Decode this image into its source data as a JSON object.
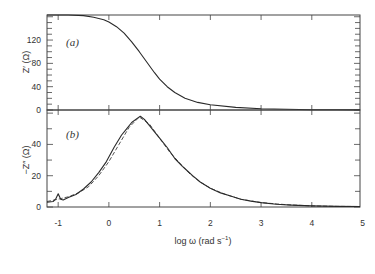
{
  "chart_data": [
    {
      "panel": "(a)",
      "type": "line",
      "xlabel": "log ω (rad s⁻¹)",
      "ylabel": "Z′ (Ω)",
      "xlim": [
        -1.22,
        4.95
      ],
      "ylim": [
        0,
        163
      ],
      "yticks": [
        0,
        40,
        80,
        120
      ],
      "yticklabels": [
        "0",
        "40",
        "80",
        "120"
      ],
      "grid": false,
      "series": [
        {
          "name": "Z′",
          "style": "solid",
          "x": [
            -1.22,
            -0.8,
            -0.5,
            -0.3,
            -0.1,
            0.0,
            0.15,
            0.3,
            0.45,
            0.6,
            0.75,
            0.9,
            1.0,
            1.15,
            1.3,
            1.5,
            1.75,
            2.0,
            2.5,
            3.0,
            3.5,
            4.0,
            4.5,
            4.95
          ],
          "values": [
            163,
            163,
            162,
            159,
            155,
            151,
            143,
            132,
            117,
            100,
            82,
            64,
            53,
            40,
            30,
            20,
            13,
            9,
            4.5,
            2.2,
            1.2,
            0.6,
            0.3,
            0.2
          ]
        }
      ]
    },
    {
      "panel": "(b)",
      "type": "line",
      "xlabel": "log ω (rad s⁻¹)",
      "ylabel": "−Z″ (Ω)",
      "xlim": [
        -1.22,
        4.95
      ],
      "ylim": [
        0,
        62
      ],
      "xticks": [
        -1,
        0,
        1,
        2,
        3,
        4,
        5
      ],
      "xticklabels": [
        "-1",
        "0",
        "1",
        "2",
        "3",
        "4",
        "5"
      ],
      "yticks": [
        0,
        20,
        40
      ],
      "yticklabels": [
        "0",
        "20",
        "40"
      ],
      "grid": false,
      "series": [
        {
          "name": "measured −Z″",
          "style": "solid",
          "x": [
            -1.22,
            -1.1,
            -1.05,
            -1.0,
            -0.95,
            -0.9,
            -0.8,
            -0.65,
            -0.5,
            -0.35,
            -0.2,
            -0.05,
            0.1,
            0.25,
            0.35,
            0.45,
            0.55,
            0.62,
            0.7,
            0.8,
            0.9,
            1.0,
            1.15,
            1.3,
            1.45,
            1.55,
            1.65,
            1.8,
            2.0,
            2.2,
            2.4,
            2.6,
            2.8,
            3.0,
            3.3,
            3.6,
            4.0,
            4.5,
            4.95
          ],
          "values": [
            3,
            3.5,
            5,
            8.5,
            5,
            4.5,
            6,
            8,
            11.5,
            16,
            22,
            29,
            38,
            46,
            50,
            54,
            56.5,
            58,
            56,
            52,
            48,
            44,
            38,
            31,
            26,
            23,
            20,
            16,
            12,
            9,
            7,
            5,
            3.8,
            2.8,
            1.8,
            1.2,
            0.7,
            0.4,
            0.3
          ]
        },
        {
          "name": "fit −Z″",
          "style": "dashed",
          "x": [
            -1.22,
            -1.0,
            -0.8,
            -0.6,
            -0.4,
            -0.2,
            0.0,
            0.2,
            0.4,
            0.6,
            0.8,
            1.0,
            1.2,
            1.4,
            1.6,
            1.8,
            2.0,
            2.3,
            2.6,
            3.0,
            3.5,
            4.0,
            4.5,
            4.95
          ],
          "values": [
            3.5,
            5,
            6.5,
            9,
            13,
            20,
            29,
            40,
            51,
            57.5,
            53,
            44,
            35,
            28,
            21,
            16,
            12,
            8,
            5,
            2.8,
            1.5,
            0.7,
            0.4,
            0.3
          ]
        }
      ]
    }
  ],
  "panels": {
    "a": {
      "label": "(a)",
      "ylabel": "Z′ (Ω)",
      "yticks": [
        "0",
        "40",
        "80",
        "120"
      ]
    },
    "b": {
      "label": "(b)",
      "ylabel": "−Z″ (Ω)",
      "yticks": [
        "0",
        "20",
        "40"
      ]
    }
  },
  "xaxis": {
    "label": "log ω (rad s⁻¹)",
    "label_main": "log ω (rad s",
    "label_sup": "−1",
    "label_end": ")",
    "ticks": [
      "-1",
      "0",
      "1",
      "2",
      "3",
      "4",
      "5"
    ]
  },
  "colors": {
    "line": "#2a2a2a",
    "axis": "#444444",
    "text": "#333333"
  }
}
